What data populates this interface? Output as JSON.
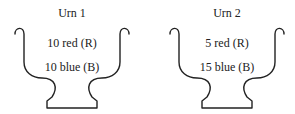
{
  "urns": [
    {
      "title": "Urn 1",
      "contents": [
        "10 red (R)",
        "10 blue (B)"
      ]
    },
    {
      "title": "Urn 2",
      "contents": [
        "5 red (R)",
        "15 blue (B)"
      ]
    }
  ],
  "colors": {
    "stroke": "#222222",
    "background": "#ffffff"
  }
}
